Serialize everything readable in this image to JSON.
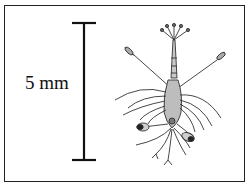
{
  "figure": {
    "scale_bar": {
      "label": "5 mm",
      "orientation": "vertical"
    },
    "specimen": {
      "description": "larval crustacean (shrimp-like zoea) line drawing"
    },
    "caption_partial": "(cut off)"
  },
  "colors": {
    "frame": "#222222",
    "ink": "#111111",
    "body_fill": "#bdbdbd",
    "background": "#ffffff"
  }
}
